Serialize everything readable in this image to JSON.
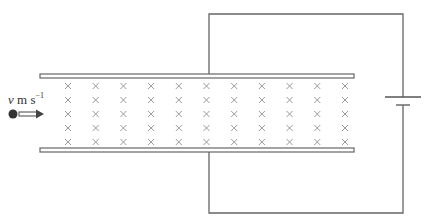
{
  "diagram": {
    "title": "",
    "velocity_label": {
      "symbol": "v",
      "units": " m s",
      "exponent": "−1"
    },
    "particle": {
      "shape": "filled-circle",
      "color": "#333333"
    },
    "velocity_arrow": {
      "direction": "right"
    },
    "magnetic_field": {
      "direction": "into-page",
      "symbol": "×",
      "columns": 11,
      "rows": 5,
      "color": "#999999"
    },
    "plates": {
      "top": {
        "x1": 40,
        "x2": 354,
        "y": 76
      },
      "bottom": {
        "x1": 40,
        "x2": 354,
        "y": 150
      }
    },
    "circuit": {
      "battery": {
        "long_plate": "top",
        "short_plate": "bottom"
      },
      "wire_color": "#666666"
    }
  }
}
